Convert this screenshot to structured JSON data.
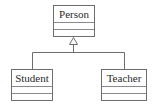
{
  "diagram": {
    "type": "uml-class-inheritance",
    "classes": [
      {
        "id": "person",
        "name": "Person",
        "attributes": [],
        "operations": []
      },
      {
        "id": "student",
        "name": "Student",
        "attributes": [],
        "operations": []
      },
      {
        "id": "teacher",
        "name": "Teacher",
        "attributes": [],
        "operations": []
      }
    ],
    "relationships": [
      {
        "type": "generalization",
        "from": "Student",
        "to": "Person"
      },
      {
        "type": "generalization",
        "from": "Teacher",
        "to": "Person"
      }
    ],
    "colors": {
      "border": "#6e6e6e",
      "text": "#2a2a2a",
      "background": "#ffffff"
    }
  }
}
